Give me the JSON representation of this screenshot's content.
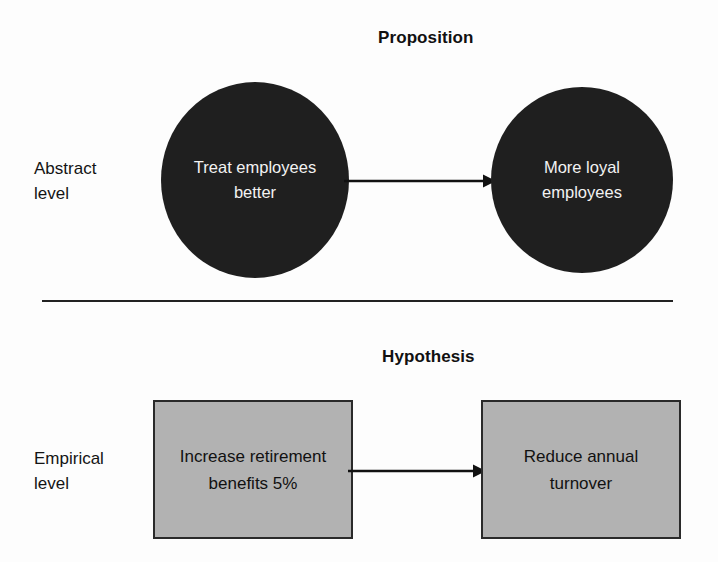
{
  "diagram": {
    "title_proposition": "Proposition",
    "title_hypothesis": "Hypothesis",
    "levels": {
      "abstract": "Abstract\nlevel",
      "abstract_line1": "Abstract",
      "abstract_line2": "level",
      "empirical": "Empirical\nlevel",
      "empirical_line1": "Empirical",
      "empirical_line2": "level"
    },
    "abstract_row": {
      "source_node": {
        "shape": "circle",
        "text": "Treat employees better",
        "line1": "Treat employees",
        "line2": "better",
        "fill": "#1f1f1f",
        "text_color": "#f2f2f2"
      },
      "target_node": {
        "shape": "circle",
        "text": "More loyal employees",
        "line1": "More loyal",
        "line2": "employees",
        "fill": "#1f1f1f",
        "text_color": "#f2f2f2"
      },
      "connector": {
        "type": "arrow",
        "direction": "right",
        "color": "#111111",
        "label": ""
      }
    },
    "empirical_row": {
      "source_node": {
        "shape": "rectangle",
        "text": "Increase retirement benefits 5%",
        "line1": "Increase retirement",
        "line2": "benefits 5%",
        "fill": "#b2b2b2",
        "border": "#2a2a2a",
        "text_color": "#111111"
      },
      "target_node": {
        "shape": "rectangle",
        "text": "Reduce annual turnover",
        "line1": "Reduce annual",
        "line2": "turnover",
        "fill": "#b2b2b2",
        "border": "#2a2a2a",
        "text_color": "#111111"
      },
      "connector": {
        "type": "arrow",
        "direction": "right",
        "color": "#111111",
        "label": ""
      }
    },
    "divider": {
      "color": "#222222"
    }
  }
}
